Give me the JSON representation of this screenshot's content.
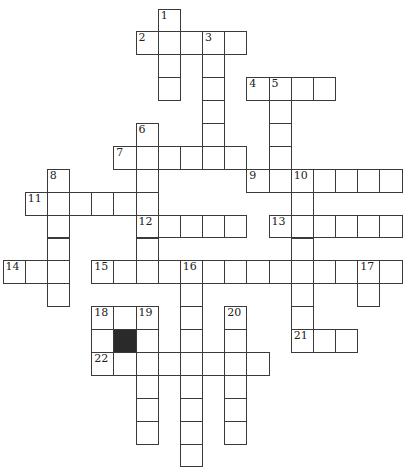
{
  "puzzle": {
    "type": "crossword",
    "grid": {
      "origin": [
        3,
        9
      ],
      "cell_w": 22.17,
      "cell_h": 22.9,
      "cols": 18,
      "rows": 20
    },
    "colors": {
      "border": "#3a3a3a",
      "black_cell": "#2a2a2a",
      "background": "#ffffff"
    },
    "entries": [
      {
        "number": "1",
        "direction": "down",
        "row": 0,
        "col": 7,
        "length": 4
      },
      {
        "number": "2",
        "direction": "across",
        "row": 1,
        "col": 6,
        "length": 5
      },
      {
        "number": "3",
        "direction": "down",
        "row": 1,
        "col": 9,
        "length": 6
      },
      {
        "number": "4",
        "direction": "across",
        "row": 3,
        "col": 11,
        "length": 4
      },
      {
        "number": "5",
        "direction": "down",
        "row": 3,
        "col": 12,
        "length": 5
      },
      {
        "number": "6",
        "direction": "down",
        "row": 5,
        "col": 6,
        "length": 7
      },
      {
        "number": "7",
        "direction": "across",
        "row": 6,
        "col": 5,
        "length": 6
      },
      {
        "number": "8",
        "direction": "down",
        "row": 7,
        "col": 2,
        "length": 6
      },
      {
        "number": "9",
        "direction": "across",
        "row": 7,
        "col": 11,
        "length": 7
      },
      {
        "number": "10",
        "direction": "down",
        "row": 7,
        "col": 13,
        "length": 8
      },
      {
        "number": "11",
        "direction": "across",
        "row": 8,
        "col": 1,
        "length": 6
      },
      {
        "number": "12",
        "direction": "across",
        "row": 9,
        "col": 6,
        "length": 5
      },
      {
        "number": "13",
        "direction": "across",
        "row": 9,
        "col": 12,
        "length": 6
      },
      {
        "number": "14",
        "direction": "across",
        "row": 11,
        "col": 0,
        "length": 3
      },
      {
        "number": "15",
        "direction": "across",
        "row": 11,
        "col": 4,
        "length": 14
      },
      {
        "number": "16",
        "direction": "down",
        "row": 11,
        "col": 8,
        "length": 9
      },
      {
        "number": "17",
        "direction": "down",
        "row": 11,
        "col": 16,
        "length": 2
      },
      {
        "number": "18",
        "direction": "across",
        "row": 13,
        "col": 4,
        "length": 3
      },
      {
        "number": "18",
        "direction": "down",
        "row": 13,
        "col": 4,
        "length": 3
      },
      {
        "number": "19",
        "direction": "down",
        "row": 13,
        "col": 6,
        "length": 6
      },
      {
        "number": "20",
        "direction": "down",
        "row": 13,
        "col": 10,
        "length": 6
      },
      {
        "number": "21",
        "direction": "across",
        "row": 14,
        "col": 13,
        "length": 3
      },
      {
        "number": "22",
        "direction": "across",
        "row": 15,
        "col": 4,
        "length": 8
      }
    ],
    "black_cells": [
      {
        "row": 14,
        "col": 5
      }
    ]
  }
}
